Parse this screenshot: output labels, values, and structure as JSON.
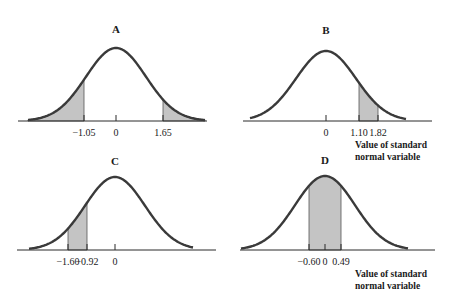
{
  "figure": {
    "axis_caption_line1": "Value of standard",
    "axis_caption_line2": "normal variable",
    "shade_color": "#c4c4c4",
    "curve_color": "#3a3a3a"
  },
  "chart_data": [
    {
      "type": "area",
      "title": "A",
      "distribution": "standard normal",
      "xlabel": "",
      "ticks": [
        -1.05,
        0,
        1.65
      ],
      "tick_labels": [
        "−1.05",
        "0",
        "1.65"
      ],
      "shaded_regions": [
        [
          -3.0,
          -1.05
        ],
        [
          1.65,
          3.0
        ]
      ],
      "shaded_description": "left tail below -1.05 and right tail above 1.65"
    },
    {
      "type": "area",
      "title": "B",
      "distribution": "standard normal",
      "xlabel": "Value of standard normal variable",
      "ticks": [
        0,
        1.1,
        1.82
      ],
      "tick_labels": [
        "0",
        "1.10",
        "1.82"
      ],
      "shaded_regions": [
        [
          1.1,
          1.82
        ]
      ],
      "shaded_description": "area between 1.10 and 1.82"
    },
    {
      "type": "area",
      "title": "C",
      "distribution": "standard normal",
      "xlabel": "",
      "ticks": [
        -1.6,
        -0.92,
        0
      ],
      "tick_labels": [
        "−1.60",
        "−0.92",
        "0"
      ],
      "shaded_regions": [
        [
          -1.6,
          -0.92
        ]
      ],
      "shaded_description": "area between -1.60 and -0.92"
    },
    {
      "type": "area",
      "title": "D",
      "distribution": "standard normal",
      "xlabel": "Value of standard normal variable",
      "ticks": [
        -0.6,
        0,
        0.49
      ],
      "tick_labels": [
        "−0.60",
        "0",
        "0.49"
      ],
      "shaded_regions": [
        [
          -0.6,
          0.49
        ]
      ],
      "shaded_description": "area between -0.60 and 0.49"
    }
  ],
  "layout": {
    "panels": [
      {
        "cx": 116,
        "axisY": 121,
        "axisX0": 18,
        "axisX1": 207,
        "peakY": 48,
        "titleY": 33,
        "tickPx": [
          84,
          116,
          163
        ],
        "shadePx": [
          [
            28,
            84
          ],
          [
            163,
            205
          ]
        ],
        "curveX0": 28,
        "curveX1": 205,
        "captionX": 357,
        "captionY": 0
      },
      {
        "cx": 326,
        "axisY": 121,
        "axisX0": 243,
        "axisX1": 432,
        "peakY": 51,
        "titleY": 34,
        "tickPx": [
          326,
          359,
          378
        ],
        "shadePx": [
          [
            359,
            378
          ]
        ],
        "curveX0": 250,
        "curveX1": 406,
        "captionX": 355,
        "captionY": 148
      },
      {
        "cx": 115,
        "axisY": 250,
        "axisX0": 17,
        "axisX1": 216,
        "peakY": 177,
        "titleY": 165,
        "tickPx": [
          68,
          87,
          115
        ],
        "shadePx": [
          [
            68,
            87
          ]
        ],
        "curveX0": 29,
        "curveX1": 193,
        "captionX": 0,
        "captionY": 0
      },
      {
        "cx": 325,
        "axisY": 250,
        "axisX0": 240,
        "axisX1": 435,
        "peakY": 176,
        "titleY": 164,
        "tickPx": [
          309,
          325,
          341
        ],
        "shadePx": [
          [
            309,
            341
          ]
        ],
        "curveX0": 241,
        "curveX1": 408,
        "captionX": 355,
        "captionY": 277
      }
    ]
  }
}
